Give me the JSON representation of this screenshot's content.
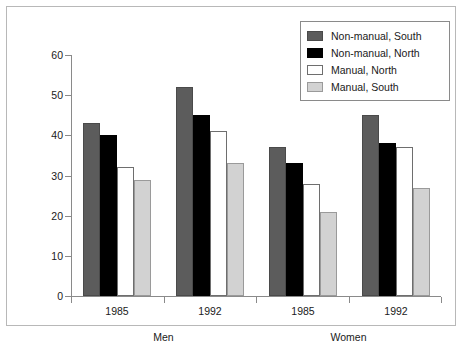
{
  "chart_data": {
    "type": "bar",
    "title": "",
    "xlabel": "",
    "ylabel": "% adults",
    "ylim": [
      0,
      60
    ],
    "yticks": [
      0,
      10,
      20,
      30,
      40,
      50,
      60
    ],
    "grid": false,
    "legend_position": "top-right",
    "categories": [
      "1985",
      "1992",
      "1985",
      "1992"
    ],
    "supergroups": [
      {
        "label": "Men",
        "categories": [
          "1985",
          "1992"
        ]
      },
      {
        "label": "Women",
        "categories": [
          "1985",
          "1992"
        ]
      }
    ],
    "series": [
      {
        "name": "Non-manual, South",
        "color": "#5c5c5c",
        "values": [
          43,
          52,
          37,
          45
        ]
      },
      {
        "name": "Non-manual, North",
        "color": "#000000",
        "values": [
          40,
          45,
          33,
          38
        ]
      },
      {
        "name": "Manual, North",
        "color": "#ffffff",
        "values": [
          32,
          41,
          28,
          37
        ]
      },
      {
        "name": "Manual, South",
        "color": "#d2d2d2",
        "values": [
          29,
          33,
          21,
          27
        ]
      }
    ]
  },
  "legend": {
    "items": [
      {
        "label": "Non-manual, South"
      },
      {
        "label": "Non-manual, North"
      },
      {
        "label": "Manual, North"
      },
      {
        "label": "Manual, South"
      }
    ]
  }
}
